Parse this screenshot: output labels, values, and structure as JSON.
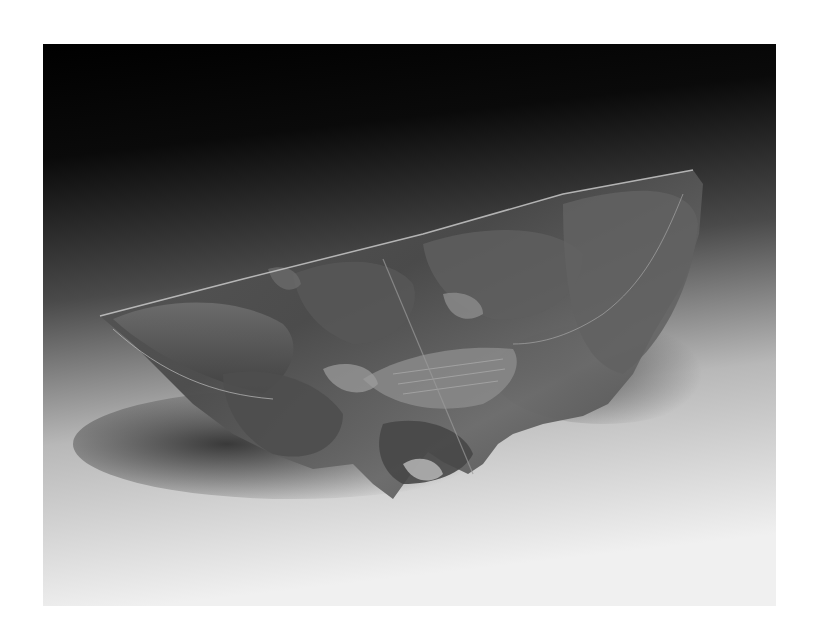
{
  "image": {
    "subject": "sculpture",
    "description": "Grayscale studio photograph of a translucent leaf-form sculptural vessel on a dark-to-light gradient backdrop",
    "colors": {
      "border": "#ffffff",
      "backdrop_top": "#000000",
      "backdrop_bottom": "#f2f2f2",
      "sculpture_dark": "#3a3a3a",
      "sculpture_mid": "#6e6e6e",
      "sculpture_light": "#9a9a9a",
      "shadow": "#2a2a2a"
    }
  }
}
